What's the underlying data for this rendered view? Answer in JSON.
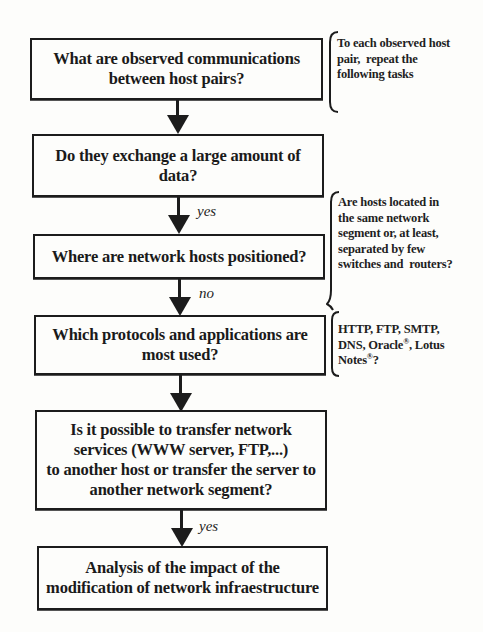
{
  "diagram": {
    "type": "flowchart",
    "nodes": [
      {
        "id": "n1",
        "lines": [
          "What are observed communications",
          "between host pairs?"
        ]
      },
      {
        "id": "n2",
        "lines": [
          "Do they exchange a large amount of",
          "data?"
        ]
      },
      {
        "id": "n3",
        "lines": [
          "Where are network hosts positioned?"
        ]
      },
      {
        "id": "n4",
        "lines": [
          "Which protocols and applications are",
          "most used?"
        ]
      },
      {
        "id": "n5",
        "lines": [
          "Is it possible to transfer network",
          "services (WWW server, FTP,...)",
          "to another host or transfer the server to",
          "another network segment?"
        ]
      },
      {
        "id": "n6",
        "lines": [
          "Analysis of the impact of the",
          "modification of network infraestructure"
        ]
      }
    ],
    "edges": [
      {
        "from": "n1",
        "to": "n2",
        "label": ""
      },
      {
        "from": "n2",
        "to": "n3",
        "label": "yes"
      },
      {
        "from": "n3",
        "to": "n4",
        "label": "no"
      },
      {
        "from": "n4",
        "to": "n5",
        "label": ""
      },
      {
        "from": "n5",
        "to": "n6",
        "label": "yes"
      }
    ],
    "annotations": [
      {
        "attached_to": "n1",
        "lines": [
          "To each observed host",
          "pair,  repeat the",
          "following tasks"
        ]
      },
      {
        "attached_to": "n3",
        "lines": [
          "Are hosts located in",
          "the same network",
          "segment or, at least,",
          "separated by few",
          "switches and  routers?"
        ]
      },
      {
        "attached_to": "n4",
        "lines": [
          "HTTP, FTP, SMTP,",
          "DNS, Oracle",
          ", Lotus",
          "Notes",
          "?"
        ],
        "registered_mark": "®"
      }
    ]
  }
}
